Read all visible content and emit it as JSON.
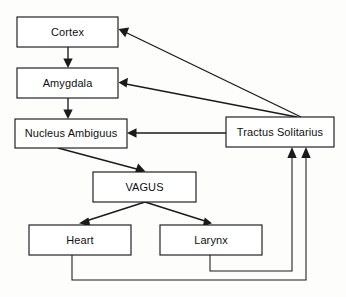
{
  "diagram": {
    "background_color": "#fdfdfc",
    "stroke_color": "#1a1a1a",
    "node_fill_color": "#ffffff",
    "nodes": [
      {
        "id": "cortex",
        "label": "Cortex",
        "x": 17,
        "y": 17,
        "w": 101,
        "h": 30
      },
      {
        "id": "amygdala",
        "label": "Amygdala",
        "x": 17,
        "y": 68,
        "w": 101,
        "h": 30
      },
      {
        "id": "nucleus_ambiguus",
        "label": "Nucleus Ambiguus",
        "x": 15,
        "y": 119,
        "w": 112,
        "h": 29
      },
      {
        "id": "tractus_solitarius",
        "label": "Tractus Solitarius",
        "x": 226,
        "y": 117,
        "w": 108,
        "h": 30
      },
      {
        "id": "vagus",
        "label": "VAGUS",
        "x": 93,
        "y": 172,
        "w": 103,
        "h": 30
      },
      {
        "id": "heart",
        "label": "Heart",
        "x": 29,
        "y": 225,
        "w": 102,
        "h": 30
      },
      {
        "id": "larynx",
        "label": "Larynx",
        "x": 160,
        "y": 225,
        "w": 102,
        "h": 30
      }
    ],
    "edges": [
      {
        "id": "cortex-to-amygdala",
        "from": "cortex",
        "to": "amygdala",
        "kind": "vertical"
      },
      {
        "id": "amygdala-to-nucleus-ambiguus",
        "from": "amygdala",
        "to": "nucleus_ambiguus",
        "kind": "vertical"
      },
      {
        "id": "nucleus-ambiguus-to-vagus",
        "from": "nucleus_ambiguus",
        "to": "vagus",
        "kind": "diagonal"
      },
      {
        "id": "vagus-to-heart",
        "from": "vagus",
        "to": "heart",
        "kind": "diagonal"
      },
      {
        "id": "vagus-to-larynx",
        "from": "vagus",
        "to": "larynx",
        "kind": "diagonal"
      },
      {
        "id": "tractus-solitarius-to-cortex",
        "from": "tractus_solitarius",
        "to": "cortex",
        "kind": "diagonal"
      },
      {
        "id": "tractus-solitarius-to-amygdala",
        "from": "tractus_solitarius",
        "to": "amygdala",
        "kind": "diagonal"
      },
      {
        "id": "tractus-solitarius-to-nucleus",
        "from": "tractus_solitarius",
        "to": "nucleus_ambiguus",
        "kind": "horizontal"
      },
      {
        "id": "heart-to-tractus-solitarius",
        "from": "heart",
        "to": "tractus_solitarius",
        "kind": "orthogonal-feedback"
      },
      {
        "id": "larynx-to-tractus-solitarius",
        "from": "larynx",
        "to": "tractus_solitarius",
        "kind": "orthogonal-feedback"
      }
    ]
  }
}
